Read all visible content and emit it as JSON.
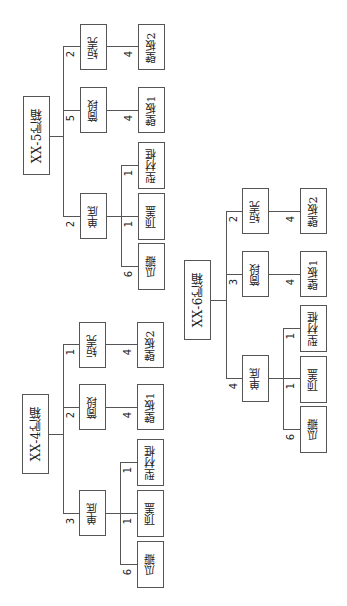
{
  "diagram": {
    "orientation": "rotated-90-ccw",
    "trees": [
      {
        "root": "XX-5贮箱",
        "children": [
          {
            "label": "短壳",
            "qty": "2",
            "children": [
              {
                "label": "壁板2",
                "qty": "4"
              }
            ]
          },
          {
            "label": "筒段",
            "qty": "5",
            "children": [
              {
                "label": "壁板1",
                "qty": "4"
              }
            ]
          },
          {
            "label": "单底",
            "qty": "2",
            "children": [
              {
                "label": "型材框",
                "qty": "1"
              },
              {
                "label": "顶盖",
                "qty": "1"
              },
              {
                "label": "瓜瓣",
                "qty": "6"
              }
            ]
          }
        ]
      },
      {
        "root": "XX-6贮箱",
        "children": [
          {
            "label": "短壳",
            "qty": "2",
            "children": [
              {
                "label": "壁板2",
                "qty": "4"
              }
            ]
          },
          {
            "label": "筒段",
            "qty": "3",
            "children": [
              {
                "label": "壁板1",
                "qty": "4"
              }
            ]
          },
          {
            "label": "单底",
            "qty": "4",
            "children": [
              {
                "label": "型材框",
                "qty": "1"
              },
              {
                "label": "顶盖",
                "qty": "1"
              },
              {
                "label": "瓜瓣",
                "qty": "6"
              }
            ]
          }
        ]
      },
      {
        "root": "XX-4贮箱",
        "children": [
          {
            "label": "短壳",
            "qty": "1",
            "children": [
              {
                "label": "壁板2",
                "qty": "4"
              }
            ]
          },
          {
            "label": "筒段",
            "qty": "2",
            "children": [
              {
                "label": "壁板1",
                "qty": "4"
              }
            ]
          },
          {
            "label": "单底",
            "qty": "3",
            "children": [
              {
                "label": "型材框",
                "qty": "1"
              },
              {
                "label": "顶盖",
                "qty": "1"
              },
              {
                "label": "瓜瓣",
                "qty": "6"
              }
            ]
          }
        ]
      }
    ]
  }
}
